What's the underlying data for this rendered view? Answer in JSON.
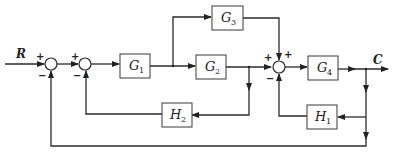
{
  "diagram": {
    "type": "control-system-block-diagram",
    "input_signal": "R",
    "output_signal": "C",
    "blocks": [
      {
        "id": "G1",
        "letter": "G",
        "sub": "1",
        "role": "forward"
      },
      {
        "id": "G2",
        "letter": "G",
        "sub": "2",
        "role": "forward"
      },
      {
        "id": "G3",
        "letter": "G",
        "sub": "3",
        "role": "feedforward-parallel"
      },
      {
        "id": "G4",
        "letter": "G",
        "sub": "4",
        "role": "forward"
      },
      {
        "id": "H1",
        "letter": "H",
        "sub": "1",
        "role": "feedback"
      },
      {
        "id": "H2",
        "letter": "H",
        "sub": "2",
        "role": "feedback"
      }
    ],
    "summing_junctions": [
      {
        "id": "S1",
        "signs": {
          "left": "+",
          "bottom": "−"
        }
      },
      {
        "id": "S2",
        "signs": {
          "left": "+",
          "bottom": "−"
        }
      },
      {
        "id": "S3",
        "signs": {
          "left": "+",
          "top": "+",
          "bottom": "−"
        }
      }
    ],
    "connections": [
      "R → S1(+)",
      "S1 → S2(+)",
      "S2 → G1",
      "G1 → G2",
      "G1 output → G3",
      "G2 → S3(+)",
      "G3 → S3(+)",
      "G2 output → H2 → S2(−)",
      "S3 → G4",
      "G4 → C",
      "C → H1 → S3(−)",
      "C → S1(−) (unity feedback)"
    ]
  }
}
